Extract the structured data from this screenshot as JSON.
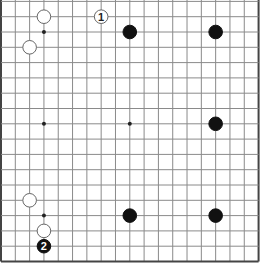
{
  "board": {
    "size": 19,
    "visible_rows": [
      1,
      18
    ],
    "visible_cols": [
      0,
      18
    ],
    "colors": {
      "background": "#ffffff",
      "grid_line": "#8a8a8a",
      "border_line": "#444444",
      "black_stone": "#111111",
      "white_stone_fill": "#ffffff",
      "white_stone_stroke": "#666666",
      "star_point": "#222222"
    },
    "star_points": [
      {
        "col": 3,
        "row": 3
      },
      {
        "col": 9,
        "row": 3
      },
      {
        "col": 15,
        "row": 3
      },
      {
        "col": 3,
        "row": 9
      },
      {
        "col": 9,
        "row": 9
      },
      {
        "col": 15,
        "row": 9
      },
      {
        "col": 3,
        "row": 15
      },
      {
        "col": 9,
        "row": 15
      },
      {
        "col": 15,
        "row": 15
      }
    ],
    "stones": [
      {
        "color": "white",
        "col": 3,
        "row": 2,
        "label": ""
      },
      {
        "color": "white",
        "col": 2,
        "row": 4,
        "label": ""
      },
      {
        "color": "white",
        "col": 7,
        "row": 2,
        "label": "1"
      },
      {
        "color": "black",
        "col": 9,
        "row": 3,
        "label": ""
      },
      {
        "color": "black",
        "col": 15,
        "row": 3,
        "label": ""
      },
      {
        "color": "black",
        "col": 15,
        "row": 9,
        "label": ""
      },
      {
        "color": "white",
        "col": 2,
        "row": 14,
        "label": ""
      },
      {
        "color": "white",
        "col": 3,
        "row": 16,
        "label": ""
      },
      {
        "color": "black",
        "col": 3,
        "row": 17,
        "label": "2"
      },
      {
        "color": "black",
        "col": 9,
        "row": 15,
        "label": ""
      },
      {
        "color": "black",
        "col": 15,
        "row": 15,
        "label": ""
      }
    ]
  }
}
